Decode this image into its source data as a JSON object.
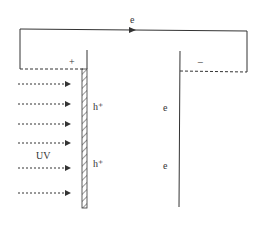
{
  "diagram": {
    "circuit": {
      "electron_label": "e",
      "direction": "anode-to-cathode"
    },
    "anode": {
      "sign_label": "+",
      "type": "photoanode (hatched)"
    },
    "cathode": {
      "sign_label": "−"
    },
    "light": {
      "label": "UV",
      "arrow_count": 6
    },
    "carriers": {
      "anode_side": [
        "h⁺",
        "h⁺"
      ],
      "cathode_side": [
        "e",
        "e"
      ]
    },
    "colors": {
      "line": "#333333",
      "background": "#ffffff"
    }
  }
}
